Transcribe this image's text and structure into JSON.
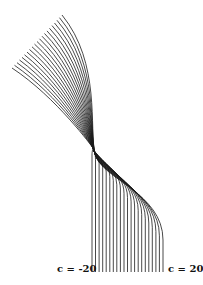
{
  "figure": {
    "stroke_color": "#1a1a1a",
    "background": "#ffffff"
  },
  "labels": {
    "left": "c = -20",
    "right": "c = 20"
  },
  "parameter": {
    "name": "c",
    "min": -20,
    "max": 20,
    "step": 2,
    "count": 21
  },
  "geometry": {
    "start_min": [
      12,
      68
    ],
    "start_max": [
      62,
      15
    ],
    "pinch_point": [
      93,
      152
    ],
    "bottom_x_min": 92,
    "bottom_x_max": 163,
    "bottom_y": 272
  }
}
